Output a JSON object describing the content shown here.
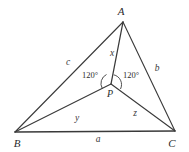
{
  "figure": {
    "kind": "geometry-diagram",
    "background_color": "#ffffff",
    "stroke_color": "#3a3a3a",
    "label_color": "#2b2b2b",
    "vertices": [
      {
        "id": "A",
        "label": "A",
        "x": 123,
        "y": 22,
        "label_x": 121,
        "label_y": 11
      },
      {
        "id": "B",
        "label": "B",
        "x": 15,
        "y": 132,
        "label_x": 17,
        "label_y": 143
      },
      {
        "id": "C",
        "label": "C",
        "x": 175,
        "y": 131,
        "label_x": 172,
        "label_y": 143
      },
      {
        "id": "P",
        "label": "P",
        "x": 111,
        "y": 84,
        "label_x": 110,
        "label_y": 94
      }
    ],
    "sides": [
      {
        "id": "a",
        "label": "a",
        "from": "B",
        "to": "C",
        "label_x": 98,
        "label_y": 140
      },
      {
        "id": "b",
        "label": "b",
        "from": "C",
        "to": "A",
        "label_x": 157,
        "label_y": 69
      },
      {
        "id": "c",
        "label": "c",
        "from": "A",
        "to": "B",
        "label_x": 68,
        "label_y": 63
      }
    ],
    "cevians": [
      {
        "id": "x",
        "label": "x",
        "from": "A",
        "to": "P",
        "label_x": 112,
        "label_y": 54
      },
      {
        "id": "y",
        "label": "y",
        "from": "B",
        "to": "P",
        "label_x": 77,
        "label_y": 119
      },
      {
        "id": "z",
        "label": "z",
        "from": "C",
        "to": "P",
        "label_x": 135,
        "label_y": 114
      }
    ],
    "angles": [
      {
        "id": "apb",
        "label": "120°",
        "at": "P",
        "label_x": 90,
        "label_y": 75
      },
      {
        "id": "apc",
        "label": "120°",
        "at": "P",
        "label_x": 131,
        "label_y": 75
      }
    ]
  }
}
